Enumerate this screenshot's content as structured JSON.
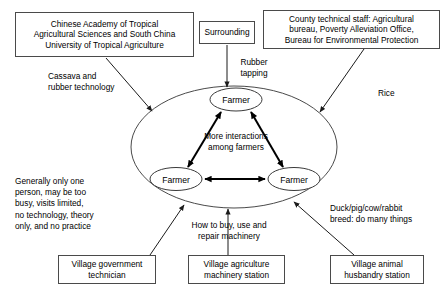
{
  "diagram": {
    "type": "node-link-diagram",
    "stroke_color": "#3a3a3a",
    "background_color": "#ffffff",
    "boxes": [
      {
        "id": "tropical-academy",
        "label": "Chinese Academy of Tropical Agricultural Sciences and South China University of Tropical Agriculture",
        "lines": [
          "Chinese Academy of Tropical",
          "Agricultural Sciences and South China",
          "University of Tropical Agriculture"
        ]
      },
      {
        "id": "surrounding",
        "label": "Surrounding",
        "lines": [
          "Surrounding"
        ]
      },
      {
        "id": "county-staff",
        "label": "County technical staff: Agricultural bureau, Poverty Alleviation Office, Bureau for Environmental Protection",
        "lines": [
          "County technical staff: Agricultural",
          "bureau, Poverty Alleviation Office,",
          "Bureau for Environmental Protection"
        ]
      },
      {
        "id": "village-government-technician",
        "label": "Village government technician",
        "lines": [
          "Village government",
          "technician"
        ]
      },
      {
        "id": "village-machinery-station",
        "label": "Village agriculture machinery station",
        "lines": [
          "Village agriculture",
          "machinery station"
        ]
      },
      {
        "id": "village-husbandry-station",
        "label": "Village animal husbandry station",
        "lines": [
          "Village animal",
          "husbandry station"
        ]
      }
    ],
    "nodes": [
      {
        "id": "farmer-top",
        "label": "Farmer"
      },
      {
        "id": "farmer-left",
        "label": "Farmer"
      },
      {
        "id": "farmer-right",
        "label": "Farmer"
      }
    ],
    "edge_labels": [
      {
        "id": "cassava-rubber",
        "text": "Cassava and\nrubber technology"
      },
      {
        "id": "rubber-tapping",
        "text": "Rubber\ntapping"
      },
      {
        "id": "rice",
        "text": "Rice"
      },
      {
        "id": "interactions",
        "text": "More interactions\namong farmers"
      },
      {
        "id": "technician-note",
        "text": "Generally only one\nperson, may be too\nbusy, visits limited,\nno technology, theory\nonly, and no practice"
      },
      {
        "id": "machinery-note",
        "text": "How to buy, use and\nrepair machinery"
      },
      {
        "id": "husbandry-note",
        "text": "Duck/pig/cow/rabbit\nbreed: do many things"
      }
    ]
  }
}
